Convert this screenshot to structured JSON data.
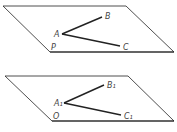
{
  "figure": {
    "top_plane": {
      "plane_label": "P",
      "vertex_a": "A",
      "vertex_b": "B",
      "vertex_c": "C"
    },
    "bottom_plane": {
      "plane_label": "O",
      "vertex_a": "A₁",
      "vertex_b": "B₁",
      "vertex_c": "C₁"
    }
  },
  "colors": {
    "stroke": "#222222",
    "label": "#444444"
  }
}
